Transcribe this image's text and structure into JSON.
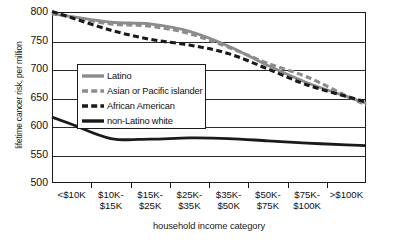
{
  "chart_data": {
    "type": "line",
    "title": "",
    "xlabel": "household income category",
    "ylabel": "lifetime cancer risk, per million",
    "ylim": [
      500,
      800
    ],
    "y_ticks": [
      800,
      750,
      700,
      650,
      600,
      550,
      500
    ],
    "grid": true,
    "legend_position": "inside-left",
    "categories": [
      "<$10K",
      "$10K-\n$15K",
      "$15K-\n$25K",
      "$25K-\n$35K",
      "$35K-\n$50K",
      "$50K-\n$75K",
      "$75K-\n$100K",
      ">$100K"
    ],
    "series": [
      {
        "name": "Latino",
        "color": "#8c8c8c",
        "style": "solid",
        "values": [
          792,
          782,
          779,
          766,
          740,
          706,
          676,
          652
        ]
      },
      {
        "name": "Asian or Pacific islander",
        "color": "#8c8c8c",
        "style": "dashed",
        "values": [
          791,
          779,
          775,
          762,
          738,
          710,
          686,
          653
        ]
      },
      {
        "name": "African American",
        "color": "#1a1a1a",
        "style": "dashed",
        "values": [
          790,
          768,
          752,
          742,
          727,
          700,
          672,
          652
        ]
      },
      {
        "name": "non-Latino white",
        "color": "#1a1a1a",
        "style": "solid",
        "values": [
          603,
          578,
          577,
          579,
          578,
          574,
          570,
          567
        ]
      }
    ]
  },
  "legend": {
    "items": [
      {
        "label": "Latino",
        "color": "#8c8c8c",
        "style": "solid"
      },
      {
        "label": "Asian or Pacific islander",
        "color": "#8c8c8c",
        "style": "dashed"
      },
      {
        "label": "African American",
        "color": "#1a1a1a",
        "style": "dashed"
      },
      {
        "label": "non-Latino white",
        "color": "#1a1a1a",
        "style": "solid"
      }
    ]
  }
}
